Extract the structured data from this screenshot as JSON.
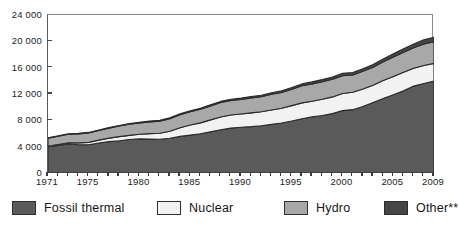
{
  "chart_data": {
    "type": "area",
    "stacked": true,
    "title": "",
    "subtitle": "",
    "xlabel": "",
    "ylabel": "",
    "xlim": [
      1971,
      2009
    ],
    "ylim": [
      0,
      24000
    ],
    "grid": false,
    "legend_position": "bottom",
    "x": [
      1971,
      1972,
      1973,
      1974,
      1975,
      1976,
      1977,
      1978,
      1979,
      1980,
      1981,
      1982,
      1983,
      1984,
      1985,
      1986,
      1987,
      1988,
      1989,
      1990,
      1991,
      1992,
      1993,
      1994,
      1995,
      1996,
      1997,
      1998,
      1999,
      2000,
      2001,
      2002,
      2003,
      2004,
      2005,
      2006,
      2007,
      2008,
      2009
    ],
    "series": [
      {
        "name": "Fossil thermal",
        "color": "#5a5a5a",
        "values": [
          3980,
          4180,
          4400,
          4300,
          4280,
          4560,
          4760,
          4900,
          5080,
          5180,
          5150,
          5120,
          5270,
          5560,
          5760,
          5960,
          6250,
          6560,
          6820,
          6960,
          7040,
          7180,
          7380,
          7600,
          7900,
          8240,
          8520,
          8740,
          9020,
          9480,
          9620,
          10100,
          10700,
          11300,
          11900,
          12500,
          13200,
          13600,
          13950
        ]
      },
      {
        "name": "Nuclear",
        "color": "#f2f2f2",
        "values": [
          110,
          150,
          200,
          270,
          370,
          430,
          540,
          630,
          640,
          700,
          830,
          920,
          1060,
          1300,
          1520,
          1650,
          1820,
          1950,
          1990,
          2010,
          2100,
          2120,
          2180,
          2240,
          2330,
          2410,
          2390,
          2450,
          2540,
          2590,
          2640,
          2660,
          2640,
          2740,
          2770,
          2790,
          2720,
          2730,
          2700
        ]
      },
      {
        "name": "Hydro",
        "color": "#a8a8a8",
        "values": [
          1200,
          1250,
          1290,
          1380,
          1440,
          1460,
          1520,
          1600,
          1680,
          1730,
          1790,
          1840,
          1930,
          1990,
          2030,
          2080,
          2120,
          2190,
          2200,
          2200,
          2250,
          2290,
          2390,
          2400,
          2490,
          2600,
          2630,
          2680,
          2680,
          2710,
          2620,
          2680,
          2720,
          2840,
          2950,
          3060,
          3100,
          3280,
          3300
        ]
      },
      {
        "name": "Other**",
        "color": "#464646",
        "values": [
          60,
          62,
          66,
          70,
          74,
          78,
          84,
          90,
          96,
          102,
          110,
          116,
          124,
          132,
          142,
          152,
          164,
          176,
          188,
          200,
          212,
          224,
          238,
          252,
          268,
          284,
          300,
          318,
          338,
          360,
          378,
          400,
          424,
          452,
          486,
          524,
          570,
          620,
          680
        ]
      }
    ],
    "yticks": [
      0,
      4000,
      8000,
      12000,
      16000,
      20000,
      24000
    ],
    "ytick_labels": [
      "0",
      "4 000",
      "8 000",
      "12 000",
      "16 000",
      "20 000",
      "24 000"
    ],
    "xticks": [
      1971,
      1975,
      1980,
      1985,
      1990,
      1995,
      2000,
      2005,
      2009
    ],
    "xtick_labels": [
      "1971",
      "1975",
      "1980",
      "1985",
      "1990",
      "1995",
      "2000",
      "2005",
      "2009"
    ],
    "minor_xtick_interval": 1
  },
  "legend": {
    "items": [
      {
        "label": "Fossil thermal",
        "color": "#5a5a5a"
      },
      {
        "label": "Nuclear",
        "color": "#f2f2f2"
      },
      {
        "label": "Hydro",
        "color": "#a8a8a8"
      },
      {
        "label": "Other**",
        "color": "#464646"
      }
    ]
  },
  "colors": {
    "fossil_thermal": "#5a5a5a",
    "nuclear": "#f2f2f2",
    "hydro": "#a8a8a8",
    "other": "#464646",
    "axis": "#4a4a4a",
    "series_outline": "#2b2b2b",
    "background": "#ffffff"
  }
}
